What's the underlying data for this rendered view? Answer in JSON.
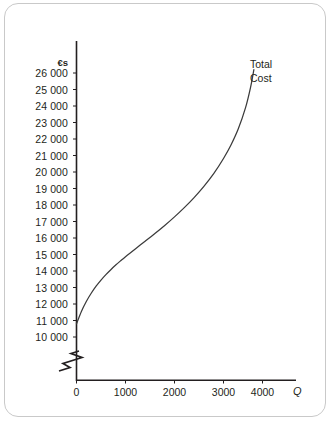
{
  "chart_data": {
    "type": "line",
    "title": "",
    "subtitle": "",
    "xlabel": "Q",
    "ylabel": "€s",
    "y_unit_header": "€s",
    "xlim": [
      0,
      4400
    ],
    "ylim": [
      9500,
      26600
    ],
    "grid": false,
    "axis_break": true,
    "axis_break_note": "zigzag break on vertical axis below 10 000",
    "legend_position": "inline-right-of-curve-end",
    "series": [
      {
        "name": "Total Cost",
        "label_lines": [
          "Total",
          "Cost"
        ],
        "color": "#3b3b3b",
        "x": [
          0,
          100,
          200,
          300,
          400,
          500,
          600,
          700,
          800,
          900,
          1000,
          1200,
          1400,
          1600,
          1800,
          2000,
          2200,
          2400,
          2600,
          2800,
          3000,
          3150,
          3300,
          3450,
          3550,
          3620
        ],
        "y": [
          10800,
          11550,
          12150,
          12650,
          13080,
          13450,
          13780,
          14080,
          14360,
          14620,
          14870,
          15340,
          15800,
          16270,
          16760,
          17280,
          17840,
          18450,
          19130,
          19900,
          20820,
          21620,
          22600,
          23900,
          25100,
          26200
        ]
      }
    ],
    "y_ticks": [
      {
        "value": 26000,
        "label": "26 000"
      },
      {
        "value": 25000,
        "label": "25 000"
      },
      {
        "value": 24000,
        "label": "24 000"
      },
      {
        "value": 23000,
        "label": "23 000"
      },
      {
        "value": 22000,
        "label": "22 000"
      },
      {
        "value": 21000,
        "label": "21 000"
      },
      {
        "value": 20000,
        "label": "20 000"
      },
      {
        "value": 19000,
        "label": "19 000"
      },
      {
        "value": 18000,
        "label": "18 000"
      },
      {
        "value": 17000,
        "label": "17 000"
      },
      {
        "value": 16000,
        "label": "16 000"
      },
      {
        "value": 15000,
        "label": "15 000"
      },
      {
        "value": 14000,
        "label": "14 000"
      },
      {
        "value": 13000,
        "label": "13 000"
      },
      {
        "value": 12000,
        "label": "12 000"
      },
      {
        "value": 11000,
        "label": "11 000"
      },
      {
        "value": 10000,
        "label": "10 000"
      }
    ],
    "x_ticks": [
      {
        "value": 0,
        "label": "0"
      },
      {
        "value": 1000,
        "label": "1000"
      },
      {
        "value": 2000,
        "label": "2000"
      },
      {
        "value": 3000,
        "label": "3000"
      },
      {
        "value": 4000,
        "label": "4000"
      }
    ]
  },
  "axes": {
    "y_axis_name": "axis-y",
    "x_axis_name": "axis-x"
  },
  "colors": {
    "curve": "#3b3b3b",
    "axis": "#231f20",
    "text": "#231f20",
    "frame": "#c9c9c9",
    "background": "#ffffff"
  }
}
